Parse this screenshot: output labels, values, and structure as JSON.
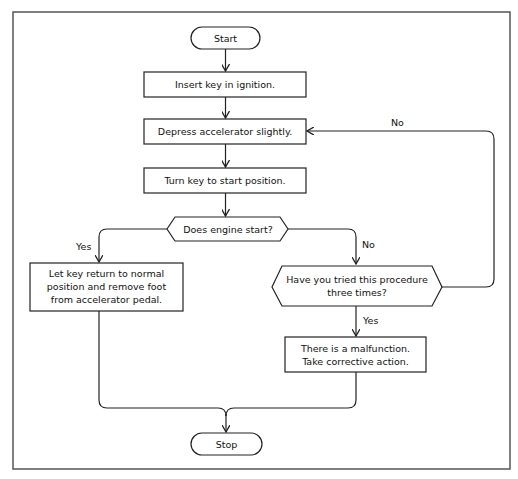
{
  "figure_label": "(a)",
  "nodes": {
    "start": "Start",
    "insert_key": "Insert key in ignition.",
    "depress": "Depress accelerator slightly.",
    "turn_key": "Turn key to start position.",
    "decision_engine": "Does engine start?",
    "let_key_return": [
      "Let key return to normal",
      "position and remove foot",
      "from accelerator pedal."
    ],
    "decision_tried": [
      "Have you tried this procedure",
      "three times?"
    ],
    "malfunction": [
      "There is a malfunction.",
      "Take corrective action."
    ],
    "stop": "Stop"
  },
  "edge_labels": {
    "engine_yes": "Yes",
    "engine_no": "No",
    "tried_yes": "Yes",
    "tried_no": "No"
  },
  "colors": {
    "stroke": "#222222",
    "frame": "#555555",
    "background": "#ffffff"
  }
}
